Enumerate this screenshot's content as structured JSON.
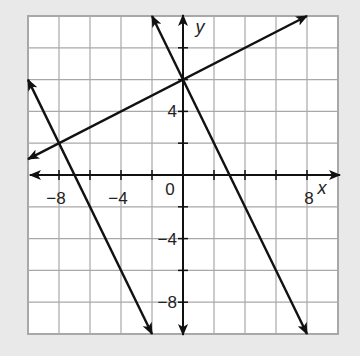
{
  "chart_data": {
    "type": "line",
    "title": "",
    "xlabel": "x",
    "ylabel": "y",
    "xlim": [
      -10,
      10
    ],
    "ylim": [
      -10,
      10
    ],
    "grid": true,
    "grid_step": 2,
    "x_tick_labels": [
      {
        "value": -8,
        "label": "−8"
      },
      {
        "value": -4,
        "label": "−4"
      },
      {
        "value": 8,
        "label": "8"
      }
    ],
    "y_tick_labels": [
      {
        "value": 4,
        "label": "4"
      },
      {
        "value": -4,
        "label": "−4"
      },
      {
        "value": -8,
        "label": "−8"
      }
    ],
    "origin_label": "0",
    "series": [
      {
        "name": "line-1",
        "equation": "y = 0.5x + 6",
        "x": [
          -10,
          8
        ],
        "y": [
          1,
          10
        ],
        "arrows": "both"
      },
      {
        "name": "line-2",
        "equation": "y = -2x + 6",
        "x": [
          -2,
          8
        ],
        "y": [
          10,
          -10
        ],
        "arrows": "both"
      },
      {
        "name": "line-3",
        "equation": "y = -2x - 14",
        "x": [
          -10,
          -2
        ],
        "y": [
          6,
          -10
        ],
        "arrows": "both"
      }
    ],
    "intersections": [
      {
        "x": 0,
        "y": 6
      },
      {
        "x": -8,
        "y": 2
      }
    ]
  },
  "colors": {
    "background": "#e9e9e9",
    "panel": "#ffffff",
    "grid": "#a8a8a8",
    "axis": "#111111",
    "line": "#111111"
  }
}
